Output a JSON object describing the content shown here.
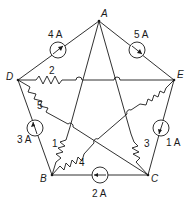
{
  "diagram": {
    "type": "circuit",
    "nodes": [
      {
        "id": "A",
        "label": "A",
        "x": 99,
        "y": 21
      },
      {
        "id": "D",
        "label": "D",
        "x": 18,
        "y": 80
      },
      {
        "id": "E",
        "label": "E",
        "x": 174,
        "y": 80
      },
      {
        "id": "B",
        "label": "B",
        "x": 52,
        "y": 175
      },
      {
        "id": "C",
        "label": "C",
        "x": 148,
        "y": 175
      }
    ],
    "current_sources": [
      {
        "id": "I4",
        "label": "4 A",
        "between": [
          "D",
          "A"
        ],
        "direction": "toward A"
      },
      {
        "id": "I5",
        "label": "5 A",
        "between": [
          "A",
          "E"
        ],
        "direction": "toward E"
      },
      {
        "id": "I3",
        "label": "3 A",
        "between": [
          "B",
          "D"
        ],
        "direction": "toward D"
      },
      {
        "id": "I1",
        "label": "1 A",
        "between": [
          "E",
          "C"
        ],
        "direction": "toward C"
      },
      {
        "id": "I2",
        "label": "2 A",
        "between": [
          "C",
          "B"
        ],
        "direction": "toward B"
      }
    ],
    "resistors": [
      {
        "id": "R2",
        "label": "2",
        "between": [
          "D",
          "E"
        ]
      },
      {
        "id": "R5",
        "label": "5",
        "between": [
          "D",
          "C"
        ]
      },
      {
        "id": "R1",
        "label": "1",
        "between": [
          "B",
          "A"
        ]
      },
      {
        "id": "R4",
        "label": "4",
        "between": [
          "B",
          "E"
        ]
      },
      {
        "id": "R3",
        "label": "3",
        "between": [
          "C",
          "A"
        ]
      }
    ]
  }
}
